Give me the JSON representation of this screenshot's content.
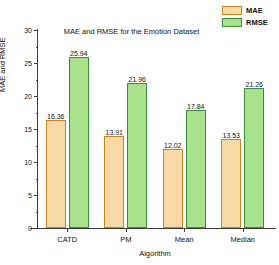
{
  "chart_data": {
    "type": "bar",
    "title": "MAE and RMSE for the Emotion Dataset",
    "xlabel": "Algorithm",
    "ylabel": "MAE and RMSE",
    "categories": [
      "CATD",
      "PM",
      "Mean",
      "Median"
    ],
    "series": [
      {
        "name": "MAE",
        "color": "#F7D9A6",
        "border_color": "#C8841E",
        "values": [
          16.36,
          13.91,
          12.02,
          13.53
        ],
        "value_labels": [
          "16.36",
          "13.91",
          "12.02",
          "13.53"
        ]
      },
      {
        "name": "RMSE",
        "color": "#A9E28C",
        "border_color": "#3E8B3E",
        "values": [
          25.94,
          21.96,
          17.84,
          21.26
        ],
        "value_labels": [
          "25.94",
          "21.96",
          "17.84",
          "21.26"
        ]
      }
    ],
    "ylim": [
      0,
      30
    ],
    "yticks": [
      0,
      5,
      10,
      15,
      20,
      25,
      30
    ],
    "ytick_labels": [
      "0",
      "5",
      "10",
      "15",
      "20",
      "25",
      "30"
    ],
    "y_minor_ticks": [
      2.5,
      7.5,
      12.5,
      17.5,
      22.5,
      27.5
    ],
    "grid": false,
    "legend_position": "top-right",
    "legend": [
      "MAE",
      "RMSE"
    ]
  }
}
